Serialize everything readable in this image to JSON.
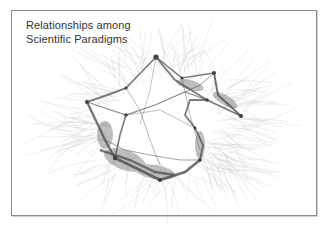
{
  "figure": {
    "title_line1": "Relationships among",
    "title_line2": "Scientific Paradigms"
  },
  "graph": {
    "type": "network",
    "edge_color": "#555555",
    "node_color": "#444444",
    "hair_color": "#9a9a9a"
  }
}
